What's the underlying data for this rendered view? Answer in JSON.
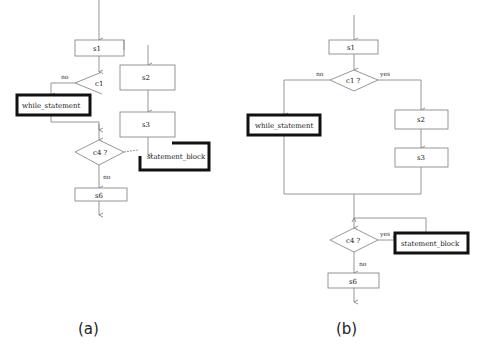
{
  "diagrams": {
    "a": {
      "caption": "(a)",
      "nodes": {
        "s1": "s1",
        "c1": "c1",
        "while_statement": "while_statement",
        "s2": "s2",
        "s3": "s3",
        "c4": "c4 ?",
        "statement_block": "statement_block",
        "s6": "s6"
      },
      "edge_labels": {
        "c1_no": "no",
        "c4_no": "no"
      }
    },
    "b": {
      "caption": "(b)",
      "nodes": {
        "s1": "s1",
        "c1": "c1 ?",
        "while_statement": "while_statement",
        "s2": "s2",
        "s3": "s3",
        "c4": "c4 ?",
        "statement_block": "statement_block",
        "s6": "s6"
      },
      "edge_labels": {
        "c1_no": "no",
        "c1_yes": "yes",
        "c4_yes": "yes",
        "c4_no": "no"
      }
    }
  },
  "colors": {
    "line": "#8a8a8a",
    "box_border": "#9a9a9a",
    "thick_border": "#111111",
    "background": "#ffffff"
  }
}
